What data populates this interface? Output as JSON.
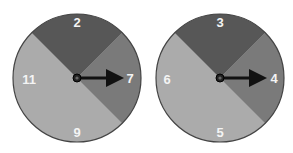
{
  "colors": {
    "dark_sector": "#575757",
    "medium_sector": "#7a7a7a",
    "light_sector": "#ababab",
    "outline": "#444444",
    "pointer": "#111111",
    "label": "#f4f4f4"
  },
  "spinners": [
    {
      "name": "spinner-left",
      "labels": {
        "top": "2",
        "right": "7",
        "bottom": "9",
        "left": "11"
      },
      "pointer_points_to": "7"
    },
    {
      "name": "spinner-right",
      "labels": {
        "top": "3",
        "right": "4",
        "bottom": "5",
        "left": "6"
      },
      "pointer_points_to": "4"
    }
  ]
}
